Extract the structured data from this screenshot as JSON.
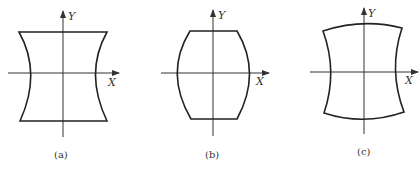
{
  "figures": [
    {
      "id": "a",
      "caption": "(a)",
      "x_axis_label": "X",
      "y_axis_label": "Y",
      "description": "pincushion-shaped outline: straight top and bottom edges, sides curving inward"
    },
    {
      "id": "b",
      "caption": "(b)",
      "x_axis_label": "X",
      "y_axis_label": "Y",
      "description": "barrel-shaped outline: straight top and bottom edges, sides bulging outward"
    },
    {
      "id": "c",
      "caption": "(c)",
      "x_axis_label": "X",
      "y_axis_label": "Y",
      "description": "outline with top and bottom edges bulging outward and sides curving inward"
    }
  ],
  "colors": {
    "stroke": "#222222",
    "background": "#ffffff"
  }
}
